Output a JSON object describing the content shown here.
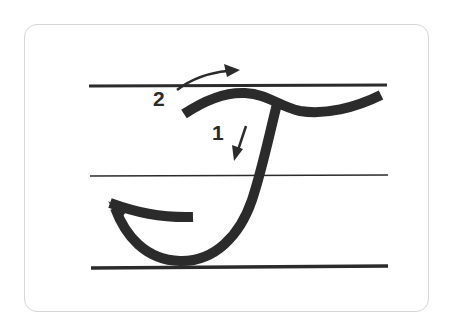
{
  "card": {
    "letter": "T",
    "style": "cursive",
    "guide_lines": [
      "top-line",
      "midline",
      "baseline"
    ],
    "strokes": [
      {
        "order_label": "1",
        "direction": "down"
      },
      {
        "order_label": "2",
        "direction": "right"
      }
    ]
  },
  "colors": {
    "ink": "#2b2b2b",
    "border": "#d6d6d6",
    "background": "#ffffff"
  }
}
